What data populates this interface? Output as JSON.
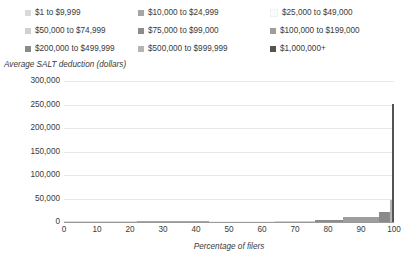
{
  "chart_data": {
    "type": "bar",
    "title": "",
    "xlabel": "Percentage of filers",
    "ylabel": "Average SALT deduction (dollars)",
    "xlim": [
      0,
      100
    ],
    "ylim": [
      0,
      300000
    ],
    "xticks": [
      "0",
      "10",
      "20",
      "30",
      "40",
      "50",
      "60",
      "70",
      "80",
      "90",
      "100"
    ],
    "yticks": [
      "0",
      "50,000",
      "100,000",
      "150,000",
      "200,000",
      "250,000",
      "300,000"
    ],
    "grid": "horizontal",
    "legend_position": "top",
    "note": "Stepped bars: each income band spans a share of filers (x width) at its average SALT deduction (y height).",
    "series": [
      {
        "name": "$1 to $9,999",
        "color": "#d9d9d9",
        "x_start": 0,
        "x_end": 22.0,
        "value": 600
      },
      {
        "name": "$10,000 to $24,999",
        "color": "#a6a6a6",
        "x_start": 22.0,
        "x_end": 44.0,
        "value": 900
      },
      {
        "name": "$25,000 to $49,000",
        "color": "#f2f2f2",
        "x_start": 44.0,
        "x_end": 64.0,
        "value": 1400
      },
      {
        "name": "$50,000 to $74,999",
        "color": "#d0d0d0",
        "x_start": 64.0,
        "x_end": 76.0,
        "value": 2600
      },
      {
        "name": "$75,000 to $99,000",
        "color": "#8c8c8c",
        "x_start": 76.0,
        "x_end": 84.5,
        "value": 5200
      },
      {
        "name": "$100,000 to $199,000",
        "color": "#9e9e9e",
        "x_start": 84.5,
        "x_end": 95.5,
        "value": 9800
      },
      {
        "name": "$200,000 to $499,999",
        "color": "#8a8a8a",
        "x_start": 95.5,
        "x_end": 98.7,
        "value": 22000
      },
      {
        "name": "$500,000 to $999,999",
        "color": "#b5b5b5",
        "x_start": 98.7,
        "x_end": 99.5,
        "value": 47000
      },
      {
        "name": "$1,000,000+",
        "color": "#545454",
        "x_start": 99.5,
        "x_end": 100.0,
        "value": 252000
      }
    ]
  },
  "legend": {
    "items": [
      {
        "label": "$1 to $9,999",
        "color": "#d9d9d9"
      },
      {
        "label": "$10,000 to $24,999",
        "color": "#a6a6a6"
      },
      {
        "label": "$25,000 to $49,000",
        "color": "#fbfbfb"
      },
      {
        "label": "$50,000 to $74,999",
        "color": "#d0d0d0"
      },
      {
        "label": "$75,000 to $99,000",
        "color": "#8c8c8c"
      },
      {
        "label": "$100,000 to $199,000",
        "color": "#9e9e9e"
      },
      {
        "label": "$200,000 to $499,999",
        "color": "#8a8a8a"
      },
      {
        "label": "$500,000 to $999,999",
        "color": "#b5b5b5"
      },
      {
        "label": "$1,000,000+",
        "color": "#545454"
      }
    ]
  }
}
